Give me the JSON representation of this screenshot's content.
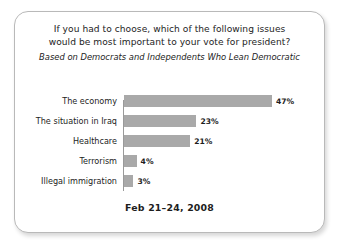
{
  "card": {
    "title_line_1": "If you had to choose, which of the following issues",
    "title_line_2": "would be most important to your vote for president?",
    "subtitle": "Based on Democrats and Independents Who Lean Democratic",
    "footer_date": "Feb 21–24, 2008"
  },
  "colors": {
    "bar_fill": "#a9a9a9",
    "axis_line": "#9a9a9a",
    "card_border": "#b9b9b9",
    "text": "#1d1d1d",
    "background": "#ffffff"
  },
  "chart_data": {
    "type": "bar",
    "orientation": "horizontal",
    "title": "If you had to choose, which of the following issues would be most important to your vote for president?",
    "subtitle": "Based on Democrats and Independents Who Lean Democratic",
    "xlabel": "",
    "ylabel": "",
    "xlim": [
      0,
      50
    ],
    "grid": false,
    "legend": false,
    "note": "Feb 21–24, 2008",
    "categories": [
      "The economy",
      "The situation in Iraq",
      "Healthcare",
      "Terrorism",
      "Illegal immigration"
    ],
    "values": [
      47,
      23,
      21,
      4,
      3
    ],
    "value_labels": [
      "47%",
      "23%",
      "21%",
      "4%",
      "3%"
    ]
  }
}
